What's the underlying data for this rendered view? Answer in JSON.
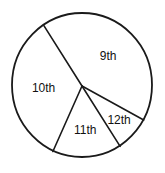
{
  "chart_data": {
    "type": "pie",
    "title": "",
    "start_angle_deg": 327,
    "direction": "clockwise",
    "slices": [
      {
        "label": "9th",
        "value": 42
      },
      {
        "label": "12th",
        "value": 8
      },
      {
        "label": "11th",
        "value": 16
      },
      {
        "label": "10th",
        "value": 34
      }
    ],
    "legend": "none",
    "colors": {
      "fill": "#ffffff",
      "stroke": "#1a1a1a",
      "text": "#111111"
    }
  }
}
